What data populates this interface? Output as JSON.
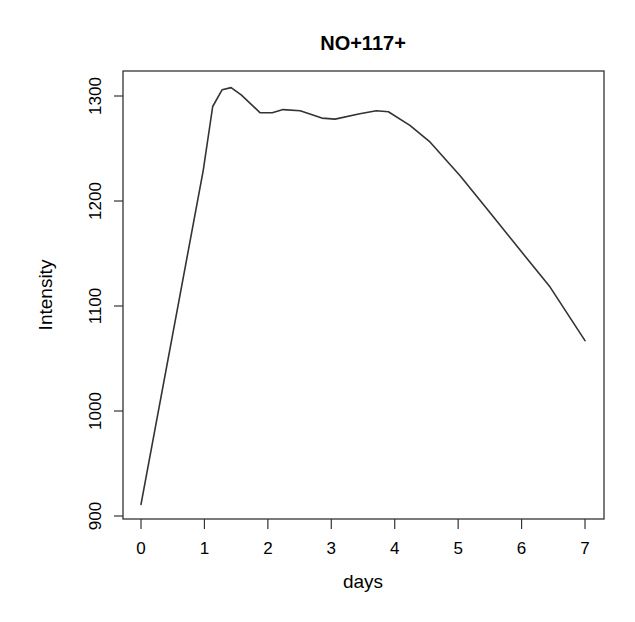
{
  "chart_data": {
    "type": "line",
    "title": "NO+117+",
    "xlabel": "days",
    "ylabel": "Intensity",
    "xlim": [
      0,
      7
    ],
    "ylim": [
      900,
      1320
    ],
    "x_ticks": [
      0,
      1,
      2,
      3,
      4,
      5,
      6,
      7
    ],
    "x_tick_labels": [
      "0",
      "1",
      "2",
      "3",
      "4",
      "5",
      "6",
      "7"
    ],
    "y_ticks": [
      900,
      1000,
      1100,
      1200,
      1300
    ],
    "y_tick_labels": [
      "900",
      "1000",
      "1100",
      "1200",
      "1300"
    ],
    "grid": false,
    "legend": null,
    "line_color": "#333333",
    "series": [
      {
        "name": "NO+117+",
        "x": [
          0,
          0.98,
          1.13,
          1.28,
          1.42,
          1.58,
          1.88,
          2.07,
          2.24,
          2.51,
          2.85,
          3.06,
          3.45,
          3.71,
          3.9,
          4.24,
          4.56,
          5.03,
          5.5,
          5.98,
          6.45,
          7.0
        ],
        "y": [
          911,
          1229,
          1290,
          1306,
          1308,
          1301,
          1284,
          1284,
          1287,
          1286,
          1279,
          1278,
          1283,
          1286,
          1285,
          1272,
          1256,
          1224,
          1189,
          1153,
          1118,
          1067
        ]
      }
    ]
  }
}
